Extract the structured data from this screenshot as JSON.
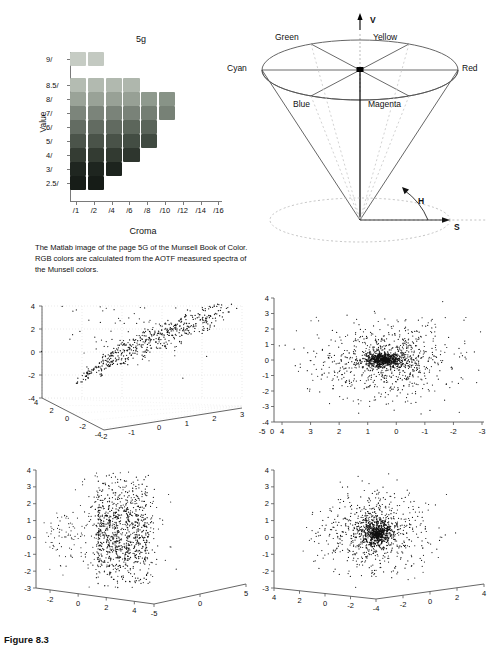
{
  "figure": {
    "caption": "Figure 8.3"
  },
  "munsell": {
    "title": "5g",
    "y_axis_label": "Value",
    "x_axis_label": "Croma",
    "y_ticks": [
      "9/",
      "8.5/",
      "8/",
      "7/",
      "6/",
      "5/",
      "4/",
      "3/",
      "2.5/"
    ],
    "x_ticks": [
      "/1",
      "/2",
      "/4",
      "/6",
      "/8",
      "/10",
      "/12",
      "/14",
      "/16"
    ],
    "caption": "The Matlab image of the page 5G of the Munsell Book of Color. RGB colors are calculated from the AOTF measured spectra of the Munsell colors.",
    "swatch_rows": [
      {
        "value": "9/",
        "colors": [
          "#c6ccc4",
          "#c3c9c1"
        ]
      },
      {
        "value": "8.5/",
        "colors": [
          "#b4bcb2",
          "#b2bab0",
          "#b1b9af",
          "#afb7ad"
        ]
      },
      {
        "value": "8/",
        "colors": [
          "#9aa398",
          "#99a297",
          "#98a196",
          "#97a095",
          "#8f9a8e",
          "#889387"
        ]
      },
      {
        "value": "7/",
        "colors": [
          "#7c857b",
          "#7b847a",
          "#7a8379",
          "#798278",
          "#747e73",
          "#778176"
        ]
      },
      {
        "value": "6/",
        "colors": [
          "#636c62",
          "#626b61",
          "#616a60",
          "#5c665b",
          "#5a645a"
        ]
      },
      {
        "value": "5/",
        "colors": [
          "#4b544a",
          "#4a5349",
          "#495248",
          "#434d43",
          "#404a41"
        ]
      },
      {
        "value": "4/",
        "colors": [
          "#343c33",
          "#333b32",
          "#323a31",
          "#2e362e"
        ]
      },
      {
        "value": "3/",
        "colors": [
          "#1f2620",
          "#1e251f",
          "#1d241e"
        ]
      },
      {
        "value": "2.5/",
        "colors": [
          "#171d18",
          "#161c17"
        ]
      }
    ]
  },
  "hsv_cone": {
    "axis_label_v": "V",
    "hue_label": "H",
    "saturation_label": "S",
    "hue_names": [
      "Green",
      "Yellow",
      "Cyan",
      "Red",
      "Blue",
      "Magenta"
    ]
  },
  "chart_data": [
    {
      "type": "scatter",
      "name": "plot-a-3d-scatter",
      "projection": "3d",
      "title": "",
      "xlabel": "",
      "ylabel": "",
      "zlabel": "",
      "z_ticks": [
        4,
        2,
        0,
        -2,
        -4
      ],
      "x_ticks": [
        4,
        2,
        0,
        -2,
        -4
      ],
      "y_ticks": [
        -2,
        -1,
        0,
        1,
        2,
        3
      ],
      "zlim": [
        -4,
        4
      ],
      "xlim": [
        -4,
        4
      ],
      "ylim": [
        -2,
        3
      ],
      "grid": true,
      "description": "3D scatter showing data clustered into parallel diagonal stripes"
    },
    {
      "type": "scatter",
      "name": "plot-b-2d-scatter",
      "projection": "2d",
      "title": "",
      "xlabel": "",
      "ylabel": "",
      "y_ticks": [
        4,
        3,
        2,
        1,
        0,
        -1,
        -2,
        -3,
        -4
      ],
      "x_ticks": [
        4,
        3,
        2,
        1,
        0,
        -1,
        -2,
        -3
      ],
      "x_extra_ticks": [
        -5,
        0
      ],
      "ylim": [
        -4,
        4
      ],
      "xlim": [
        4,
        -3
      ],
      "x_reversed": true,
      "grid": false,
      "description": "Dense elliptical point cloud with dark core near origin"
    },
    {
      "type": "scatter",
      "name": "plot-c-3d-scatter",
      "projection": "3d",
      "title": "",
      "xlabel": "",
      "ylabel": "",
      "zlabel": "",
      "z_ticks": [
        4,
        3,
        2,
        1,
        0,
        -1,
        -2,
        -3
      ],
      "x_ticks": [
        -2,
        0,
        2,
        4
      ],
      "y_ticks": [
        -5,
        0,
        5
      ],
      "zlim": [
        -3,
        4
      ],
      "grid": false,
      "description": "3D scatter with vertical striped bands of points"
    },
    {
      "type": "scatter",
      "name": "plot-d-3d-scatter",
      "projection": "3d",
      "title": "",
      "xlabel": "",
      "ylabel": "",
      "zlabel": "",
      "z_ticks": [
        4,
        3,
        2,
        1,
        0,
        -1,
        -2,
        -3
      ],
      "x_ticks": [
        4,
        2,
        0,
        -2,
        -4
      ],
      "y_ticks": [
        -2,
        0,
        2,
        4
      ],
      "zlim": [
        -3,
        4
      ],
      "grid": false,
      "description": "Radially symmetric dense point cloud with dark center"
    }
  ]
}
